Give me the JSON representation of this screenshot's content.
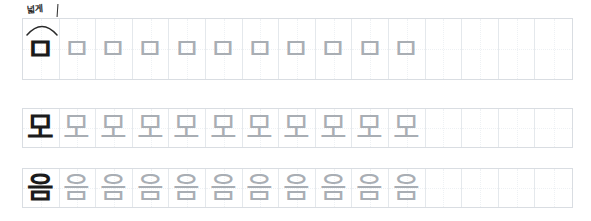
{
  "worksheet": {
    "title": "Korean handwriting practice sheet",
    "background_color": "#ffffff",
    "model_ink_color": "#1b1b1b",
    "trace_ink_color": "#a9aeb4",
    "grid_border_color": "#d9dde2",
    "grid_line_color": "#e4e8ec",
    "annotation": {
      "text": "넓게",
      "meaning_visible": false,
      "mark": "arc-bracket"
    },
    "rows": [
      {
        "id": "row-1",
        "character": "ㅁ",
        "model_count": 1,
        "trace_count": 10,
        "cell_count": 15,
        "glyphs": [
          "ㅁ",
          "ㅁ",
          "ㅁ",
          "ㅁ",
          "ㅁ",
          "ㅁ",
          "ㅁ",
          "ㅁ",
          "ㅁ",
          "ㅁ",
          "ㅁ",
          "",
          "",
          "",
          ""
        ],
        "kinds": [
          "model",
          "trace",
          "trace",
          "trace",
          "trace",
          "trace",
          "trace",
          "trace",
          "trace",
          "trace",
          "trace",
          "empty",
          "empty",
          "empty",
          "empty"
        ]
      },
      {
        "id": "row-2",
        "character": "모",
        "model_count": 1,
        "trace_count": 10,
        "cell_count": 15,
        "glyphs": [
          "모",
          "모",
          "모",
          "모",
          "모",
          "모",
          "모",
          "모",
          "모",
          "모",
          "모",
          "",
          "",
          "",
          ""
        ],
        "kinds": [
          "model",
          "trace",
          "trace",
          "trace",
          "trace",
          "trace",
          "trace",
          "trace",
          "trace",
          "trace",
          "trace",
          "empty",
          "empty",
          "empty",
          "empty"
        ]
      },
      {
        "id": "row-3",
        "character": "음",
        "model_count": 1,
        "trace_count": 10,
        "cell_count": 15,
        "glyphs": [
          "음",
          "음",
          "음",
          "음",
          "음",
          "음",
          "음",
          "음",
          "음",
          "음",
          "음",
          "",
          "",
          "",
          ""
        ],
        "kinds": [
          "model",
          "trace",
          "trace",
          "trace",
          "trace",
          "trace",
          "trace",
          "trace",
          "trace",
          "trace",
          "trace",
          "empty",
          "empty",
          "empty",
          "empty"
        ]
      }
    ]
  }
}
